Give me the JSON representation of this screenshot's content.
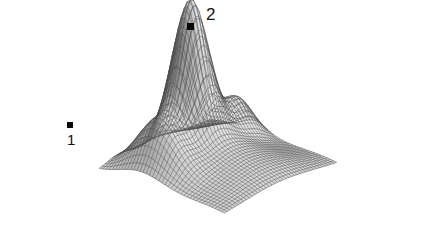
{
  "figure": {
    "type": "surface-mesh-plot",
    "background_color": "#ffffff",
    "mesh_line_color": "#4a4a4a",
    "surface_fill_color": "#fbfbfb",
    "shadow_color": "#5a5a5a",
    "marker_color": "#0a0a0a",
    "label_color": "#111111",
    "width": 434,
    "height": 243
  },
  "annotations": {
    "marker1": {
      "label": "1",
      "marker_x": 70,
      "marker_y": 125,
      "marker_size": 6,
      "label_x": 67,
      "label_y": 132,
      "label_font_size": 15
    },
    "marker2": {
      "label": "2",
      "marker_x": 190,
      "marker_y": 26,
      "marker_size": 7,
      "label_x": 206,
      "label_y": 6,
      "label_font_size": 17
    }
  },
  "chart_data": {
    "type": "surface",
    "title": "",
    "xlabel": "",
    "ylabel": "",
    "zlabel": "",
    "grid": true,
    "legend": false,
    "grid_divisions_u": 40,
    "grid_divisions_v": 40,
    "xlim": [
      -3.0,
      3.0
    ],
    "ylim": [
      -3.0,
      3.0
    ],
    "zlim": [
      0.0,
      1.0
    ],
    "projection": {
      "azimuth_deg": -48,
      "elevation_deg": 24,
      "scale_x": 168,
      "scale_y": 168,
      "scale_z": 150,
      "origin_x": 218,
      "origin_y": 168
    },
    "components": [
      {
        "name": "main-peak",
        "cx": -0.1,
        "cy": 1.25,
        "amp": 1.0,
        "sx": 0.72,
        "sy": 0.62
      },
      {
        "name": "left-ridge",
        "cx": -2.05,
        "cy": 1.1,
        "amp": 0.3,
        "sx": 0.55,
        "sy": 0.95
      },
      {
        "name": "right-bump",
        "cx": 2.05,
        "cy": 0.95,
        "amp": 0.26,
        "sx": 0.62,
        "sy": 0.58
      },
      {
        "name": "central-spread",
        "cx": -0.1,
        "cy": 0.15,
        "amp": 0.22,
        "sx": 1.6,
        "sy": 1.5
      },
      {
        "name": "front-lift",
        "cx": 0.0,
        "cy": -2.4,
        "amp": 0.06,
        "sx": 2.2,
        "sy": 0.9
      }
    ],
    "marker_points": [
      {
        "label": "1",
        "x": -1.95,
        "y": 0.3,
        "note": "on shaded left flank"
      },
      {
        "label": "2",
        "x": -0.1,
        "y": 1.25,
        "note": "at apex of main peak"
      }
    ]
  }
}
